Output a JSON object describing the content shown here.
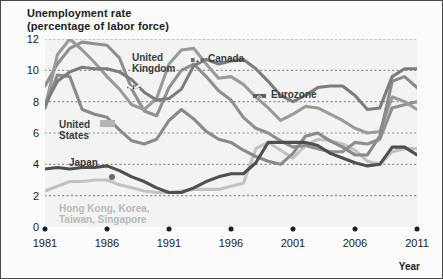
{
  "title": {
    "line1": "Unemployment rate",
    "line2": "(percentage of labor force)"
  },
  "axes": {
    "xaxis_title": "Year",
    "yticks": [
      "0",
      "2",
      "4",
      "6",
      "8",
      "10",
      "12"
    ],
    "xticks": [
      "1981",
      "1986",
      "1991",
      "1996",
      "2001",
      "2006",
      "2011"
    ]
  },
  "labels": {
    "united_kingdom": "United\nKingdom",
    "united_kingdom_l1": "United",
    "united_kingdom_l2": "Kingdom",
    "canada": "Canada",
    "eurozone": "Eurozone",
    "united_states_l1": "United",
    "united_states_l2": "States",
    "japan": "Japan",
    "tigers_l1": "Hong Kong, Korea,",
    "tigers_l2": "Taiwan, Singapore"
  },
  "icons": {
    "uk_flag": "union-jack-flag-icon",
    "canada_flag": "canada-maple-leaf-flag-icon",
    "eurozone_flag": "european-union-flag-icon",
    "us_marker": "united-states-marker-icon",
    "japan_marker": "japan-marker-icon",
    "tigers_marker": "asian-tigers-marker-icon"
  },
  "colors": {
    "plot_background": "#f3f3f3",
    "figure_background": "#fbfbfb",
    "border": "#4a4a4a",
    "gridline": "#8c8c8c",
    "united_kingdom": "#8f8f8f",
    "canada": "#9a9a9a",
    "eurozone": "#7c7c7c",
    "united_states": "#8a8a8a",
    "japan": "#4f4f4f",
    "tigers": "#c2c2c2",
    "text": "#1b1b1b"
  },
  "chart_data": {
    "type": "line",
    "title": "Unemployment rate (percentage of labor force)",
    "xlabel": "Year",
    "ylabel": "Unemployment rate (percentage of labor force)",
    "xlim": [
      1981,
      2011
    ],
    "ylim": [
      0,
      12
    ],
    "grid": true,
    "legend": "inline-annotations",
    "x": [
      1981,
      1982,
      1983,
      1984,
      1985,
      1986,
      1987,
      1988,
      1989,
      1990,
      1991,
      1992,
      1993,
      1994,
      1995,
      1996,
      1997,
      1998,
      1999,
      2000,
      2001,
      2002,
      2003,
      2004,
      2005,
      2006,
      2007,
      2008,
      2009,
      2010,
      2011
    ],
    "series": [
      {
        "name": "United Kingdom",
        "color": "#8f8f8f",
        "values": [
          9.0,
          10.4,
          11.4,
          11.8,
          11.7,
          11.6,
          10.8,
          8.8,
          7.4,
          7.1,
          8.9,
          10.0,
          10.4,
          9.6,
          8.7,
          8.1,
          7.0,
          6.3,
          6.0,
          5.5,
          5.1,
          5.2,
          5.0,
          4.8,
          4.8,
          5.4,
          5.3,
          5.6,
          7.6,
          7.8,
          8.0
        ]
      },
      {
        "name": "Canada",
        "color": "#9a9a9a",
        "values": [
          7.6,
          11.0,
          12.0,
          11.3,
          10.5,
          9.6,
          8.8,
          7.8,
          7.5,
          8.2,
          10.4,
          11.3,
          11.4,
          10.4,
          9.5,
          9.6,
          9.1,
          8.3,
          7.6,
          6.8,
          7.2,
          7.7,
          7.6,
          7.2,
          6.8,
          6.3,
          6.0,
          6.1,
          8.3,
          8.0,
          7.5
        ]
      },
      {
        "name": "Eurozone",
        "color": "#7c7c7c",
        "values": [
          7.8,
          9.3,
          9.9,
          10.2,
          10.1,
          10.1,
          9.9,
          9.4,
          8.6,
          8.1,
          8.2,
          8.8,
          10.3,
          10.7,
          10.4,
          10.6,
          10.7,
          10.1,
          9.3,
          8.4,
          8.0,
          8.4,
          8.9,
          9.0,
          9.0,
          8.4,
          7.5,
          7.6,
          9.6,
          10.1,
          10.1
        ]
      },
      {
        "name": "United States",
        "color": "#8a8a8a",
        "values": [
          7.6,
          9.7,
          9.6,
          7.5,
          7.2,
          7.0,
          6.2,
          5.5,
          5.3,
          5.6,
          6.8,
          7.5,
          6.9,
          6.1,
          5.6,
          5.4,
          4.9,
          4.5,
          4.2,
          4.0,
          4.7,
          5.8,
          6.0,
          5.5,
          5.1,
          4.6,
          4.6,
          5.8,
          9.3,
          9.6,
          8.9
        ]
      },
      {
        "name": "Japan",
        "color": "#4f4f4f",
        "values": [
          3.7,
          3.8,
          3.7,
          3.8,
          3.8,
          3.9,
          3.6,
          3.2,
          2.9,
          2.5,
          2.2,
          2.2,
          2.5,
          2.9,
          3.2,
          3.4,
          3.4,
          4.1,
          5.4,
          5.4,
          5.4,
          5.4,
          5.2,
          4.7,
          4.4,
          4.1,
          3.9,
          4.0,
          5.1,
          5.1,
          4.6
        ]
      },
      {
        "name": "Hong Kong, Korea, Taiwan, Singapore",
        "color": "#c2c2c2",
        "values": [
          2.3,
          2.6,
          2.9,
          2.9,
          3.0,
          3.0,
          2.7,
          2.5,
          2.3,
          2.2,
          2.2,
          2.3,
          2.4,
          2.4,
          2.4,
          2.6,
          2.8,
          5.0,
          5.4,
          4.9,
          4.4,
          5.2,
          5.6,
          5.5,
          5.3,
          4.9,
          4.2,
          4.0,
          4.8,
          5.0,
          5.0
        ]
      }
    ]
  }
}
